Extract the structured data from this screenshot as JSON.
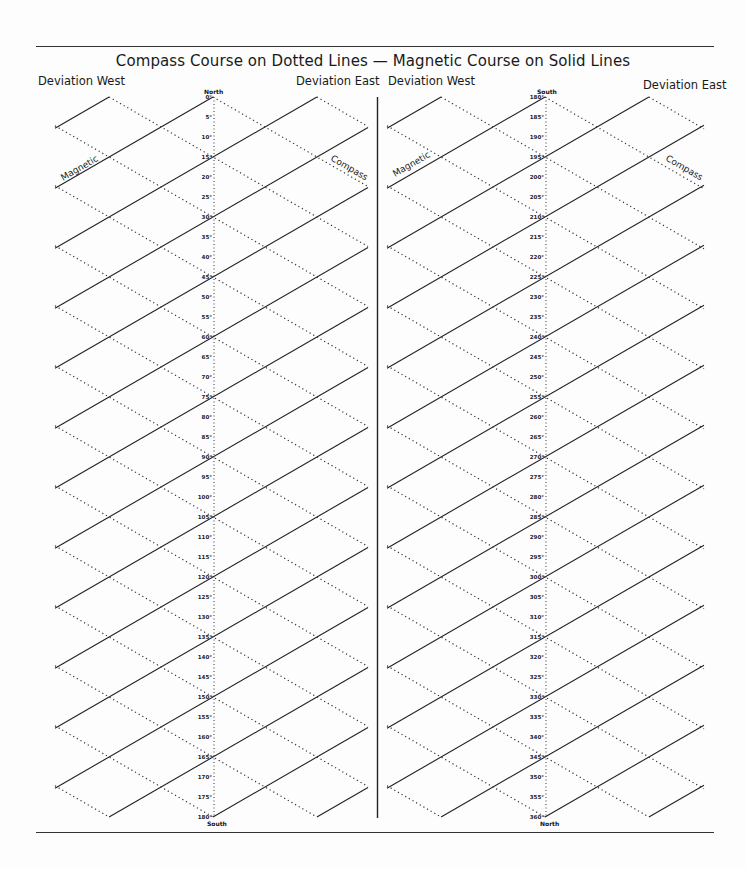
{
  "title": "Compass Course on Dotted Lines — Magnetic Course on Solid Lines",
  "left_panel": {
    "deviation_west_label": "Deviation West",
    "deviation_east_label": "Deviation East",
    "top_label": "North",
    "bottom_label": "South",
    "scale_start": 0,
    "scale_end": 180,
    "scale_step": 5,
    "magnetic_label": "Magnetic",
    "compass_label": "Compass"
  },
  "right_panel": {
    "deviation_west_label": "Deviation West",
    "deviation_east_label": "Deviation East",
    "top_label": "South",
    "bottom_label": "North",
    "scale_start": 180,
    "scale_end": 360,
    "scale_step": 5,
    "magnetic_label": "Magnetic",
    "compass_label": "Compass"
  },
  "geometry": {
    "panels": [
      {
        "center_x": 213,
        "left_x": 55,
        "right_x": 368,
        "key": "left_panel"
      },
      {
        "center_x": 545,
        "left_x": 387,
        "right_x": 704,
        "key": "right_panel"
      }
    ],
    "top_y": 97,
    "bottom_y": 817,
    "px_per_degree": 4,
    "line_interval_degrees": 15,
    "slope": 0.5774
  },
  "chart_data": {
    "type": "diagram",
    "title": "Compass Course on Dotted Lines — Magnetic Course on Solid Lines",
    "scales": [
      {
        "from": 0,
        "to": 180,
        "step": 5,
        "top": "North",
        "bottom": "South"
      },
      {
        "from": 180,
        "to": 360,
        "step": 5,
        "top": "South",
        "bottom": "North"
      }
    ],
    "solid_lines": "Magnetic course",
    "dotted_lines": "Compass course",
    "side_labels": [
      "Deviation West",
      "Deviation East"
    ]
  }
}
